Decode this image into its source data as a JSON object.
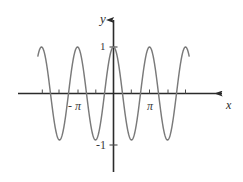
{
  "figure": {
    "background_color": "#ffffff",
    "curve_color": "#7a7a7a",
    "axis_color": "#2b2b2b",
    "width": 243,
    "height": 182
  },
  "labels": {
    "y_axis": "y",
    "x_axis": "x",
    "neg_pi": "- π",
    "pi": "π",
    "one": "1",
    "neg_one": "-1"
  },
  "chart_data": {
    "type": "line",
    "title": "",
    "xlabel": "x",
    "ylabel": "y",
    "function": "y = cos(2x)",
    "grid": false,
    "legend": null,
    "xlim": [
      -7.2,
      7.2
    ],
    "ylim": [
      -1.45,
      1.6
    ],
    "xticks": [
      -6.283185,
      -4.712389,
      -3.141593,
      -1.570796,
      1.570796,
      3.141593,
      4.712389,
      6.283185
    ],
    "xtick_labels": [
      "",
      "",
      "- π",
      "",
      "",
      "π",
      "",
      ""
    ],
    "yticks": [
      -1,
      1
    ],
    "ytick_labels": [
      "-1",
      "1"
    ],
    "series": [
      {
        "name": "y = cos(2x)",
        "color": "#7a7a7a",
        "x": [
          -6.6,
          -6.4,
          -6.2,
          -6.0,
          -5.8,
          -5.6,
          -5.4,
          -5.2,
          -5.0,
          -4.8,
          -4.6,
          -4.4,
          -4.2,
          -4.0,
          -3.8,
          -3.6,
          -3.4,
          -3.2,
          -3.0,
          -2.8,
          -2.6,
          -2.4,
          -2.2,
          -2.0,
          -1.8,
          -1.6,
          -1.4,
          -1.2,
          -1.0,
          -0.8,
          -0.6,
          -0.4,
          -0.2,
          0.0,
          0.2,
          0.4,
          0.6,
          0.8,
          1.0,
          1.2,
          1.4,
          1.6,
          1.8,
          2.0,
          2.2,
          2.4,
          2.6,
          2.8,
          3.0,
          3.2,
          3.4,
          3.6,
          3.8,
          4.0,
          4.2,
          4.4,
          4.6,
          4.8,
          5.0,
          5.2,
          5.4,
          5.6,
          5.8,
          6.0,
          6.2,
          6.4,
          6.6
        ],
        "y": [
          0.75,
          0.92,
          0.99,
          0.96,
          0.83,
          0.61,
          0.33,
          0.01,
          -0.31,
          -0.6,
          -0.82,
          -0.96,
          -1.0,
          -0.94,
          -0.78,
          -0.55,
          -0.27,
          0.05,
          0.37,
          0.64,
          0.86,
          0.98,
          1.0,
          0.92,
          0.74,
          0.49,
          0.19,
          -0.14,
          -0.42,
          -0.7,
          -0.9,
          -0.99,
          -0.99,
          1.0,
          -0.92,
          -0.7,
          -0.36,
          0.03,
          0.42,
          0.75,
          0.96,
          1.0,
          0.87,
          0.59,
          0.19,
          -0.25,
          -0.65,
          -0.91,
          -1.0,
          -0.9,
          -0.62,
          -0.23,
          0.21,
          0.62,
          0.9,
          1.0,
          0.89,
          0.6,
          0.18,
          -0.27,
          -0.67,
          -0.93,
          -1.0,
          -0.87,
          -0.56,
          -0.15,
          0.3
        ]
      }
    ],
    "annotations": [
      {
        "text": "1",
        "x": 0,
        "y": 1,
        "position": "left-of-y-axis"
      },
      {
        "text": "-1",
        "x": 0,
        "y": -1,
        "position": "left-of-y-axis"
      },
      {
        "text": "- π",
        "x": -3.141593,
        "y": 0,
        "position": "below-x-axis"
      },
      {
        "text": "π",
        "x": 3.141593,
        "y": 0,
        "position": "below-x-axis"
      }
    ]
  }
}
